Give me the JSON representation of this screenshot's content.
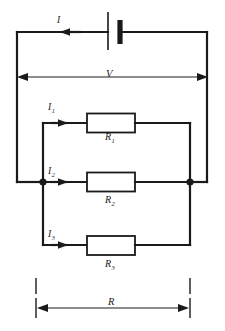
{
  "diagram": {
    "type": "electrical-circuit-schematic",
    "source": {
      "component": "battery",
      "symbol": "battery-cell",
      "current_label": "I",
      "voltage_label": "V"
    },
    "branches": [
      {
        "current_label": "I",
        "subscript": "1",
        "resistor_label": "R",
        "resistor_subscript": "1"
      },
      {
        "current_label": "I",
        "subscript": "2",
        "resistor_label": "R",
        "resistor_subscript": "2"
      },
      {
        "current_label": "I",
        "subscript": "3",
        "resistor_label": "R",
        "resistor_subscript": "3"
      }
    ],
    "equivalent": {
      "label": "R"
    },
    "labels": {
      "total_current": "I",
      "source_voltage": "V",
      "branch1_current": "I",
      "branch1_current_sub": "1",
      "branch2_current": "I",
      "branch2_current_sub": "2",
      "branch3_current": "I",
      "branch3_current_sub": "3",
      "resistor1": "R",
      "resistor1_sub": "1",
      "resistor2": "R",
      "resistor2_sub": "2",
      "resistor3": "R",
      "resistor3_sub": "3",
      "equivalent_resistance": "R"
    },
    "colors": {
      "wire": "#1a1a1a",
      "background": "#ffffff",
      "dimension": "#1a1a1a"
    }
  }
}
